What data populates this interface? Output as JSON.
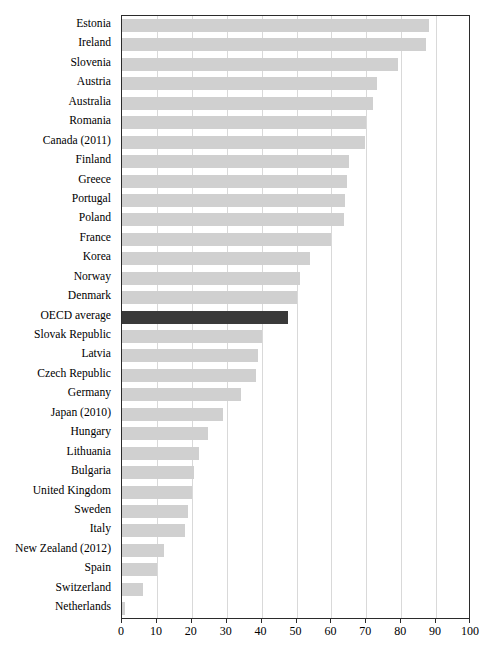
{
  "chart_data": {
    "type": "bar",
    "orientation": "horizontal",
    "title": "",
    "subtitle": "",
    "xlabel": "",
    "ylabel": "",
    "xlim": [
      0,
      100
    ],
    "xticks": [
      0,
      10,
      20,
      30,
      40,
      50,
      60,
      70,
      80,
      90,
      100
    ],
    "grid": "vertical",
    "legend": "none",
    "categories": [
      "Estonia",
      "Ireland",
      "Slovenia",
      "Austria",
      "Australia",
      "Romania",
      "Canada (2011)",
      "Finland",
      "Greece",
      "Portugal",
      "Poland",
      "France",
      "Korea",
      "Norway",
      "Denmark",
      "OECD average",
      "Slovak Republic",
      "Latvia",
      "Czech Republic",
      "Germany",
      "Japan (2010)",
      "Hungary",
      "Lithuania",
      "Bulgaria",
      "United Kingdom",
      "Sweden",
      "Italy",
      "New Zealand (2012)",
      "Spain",
      "Switzerland",
      "Netherlands"
    ],
    "values": [
      88,
      87,
      79,
      73,
      72,
      70,
      69.5,
      65,
      64.5,
      64,
      63.5,
      60,
      54,
      51,
      50,
      47.5,
      40,
      39,
      38.5,
      34,
      29,
      24.5,
      22,
      20.5,
      20,
      19,
      18,
      12,
      10,
      6,
      1
    ],
    "highlight_category": "OECD average",
    "colors": {
      "bar": "#d0d0d0",
      "highlight_bar": "#3a3a3a",
      "gridline": "#d9d9d9",
      "axis": "#2b2b2b",
      "text": "#000000",
      "background": "#ffffff"
    }
  }
}
